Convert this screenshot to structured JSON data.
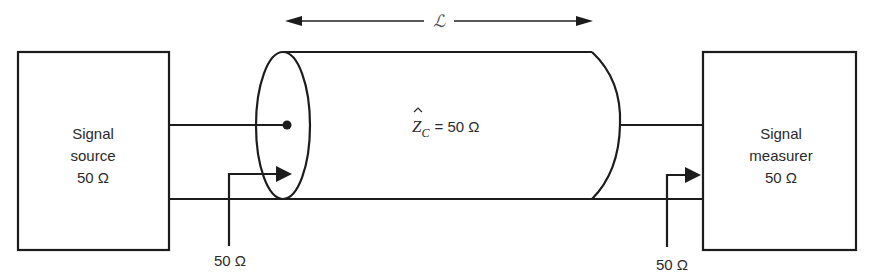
{
  "diagram": {
    "length_label": "ℒ",
    "line": {
      "impedance_symbol": "Z",
      "impedance_subscript": "C",
      "impedance_equals": "= 50 Ω"
    },
    "source_box": {
      "lines": [
        "Signal",
        "source",
        "50 Ω"
      ]
    },
    "measurer_box": {
      "lines": [
        "Signal",
        "measurer",
        "50 Ω"
      ]
    },
    "input_impedance_label": "50 Ω",
    "output_impedance_label": "50 Ω",
    "colors": {
      "stroke": "#1c1c1c",
      "text": "#2a2a2a",
      "background": "#ffffff"
    }
  }
}
